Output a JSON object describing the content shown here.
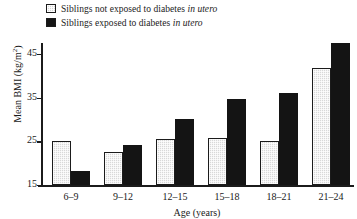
{
  "chart_data": {
    "type": "bar",
    "title": "",
    "xlabel": "Age (years)",
    "ylabel": "Mean BMI (kg/m",
    "ylabel_sup": "2",
    "ylabel_suffix": ")",
    "ylabel_full": "Mean BMI (kg/m2)",
    "categories": [
      "6–9",
      "9–12",
      "12–15",
      "15–18",
      "18–21",
      "21–24"
    ],
    "ylim": [
      15,
      47.5
    ],
    "yticks": [
      15,
      25,
      35,
      45
    ],
    "ytick_labels": [
      "15",
      "25",
      "35",
      "45"
    ],
    "grid": false,
    "legend_position": "top-left-above-axes",
    "series": [
      {
        "name": "Siblings not exposed to diabetes in utero",
        "name_plain": "Siblings not exposed to diabetes",
        "name_italic": "in utero",
        "color": "#d8d8d8",
        "values": [
          25.0,
          22.5,
          25.6,
          25.8,
          25.0,
          41.8
        ]
      },
      {
        "name": "Siblings exposed to diabetes in utero",
        "name_plain": "Siblings exposed to diabetes",
        "name_italic": "in utero",
        "color": "#141414",
        "values": [
          18.3,
          24.2,
          30.0,
          34.7,
          36.1,
          47.4
        ]
      }
    ]
  },
  "legend": {
    "items": [
      {
        "prefix": "Siblings not exposed to diabetes ",
        "italic": "in utero",
        "swatch": "light"
      },
      {
        "prefix": "Siblings exposed to diabetes ",
        "italic": "in utero",
        "swatch": "dark"
      }
    ]
  }
}
